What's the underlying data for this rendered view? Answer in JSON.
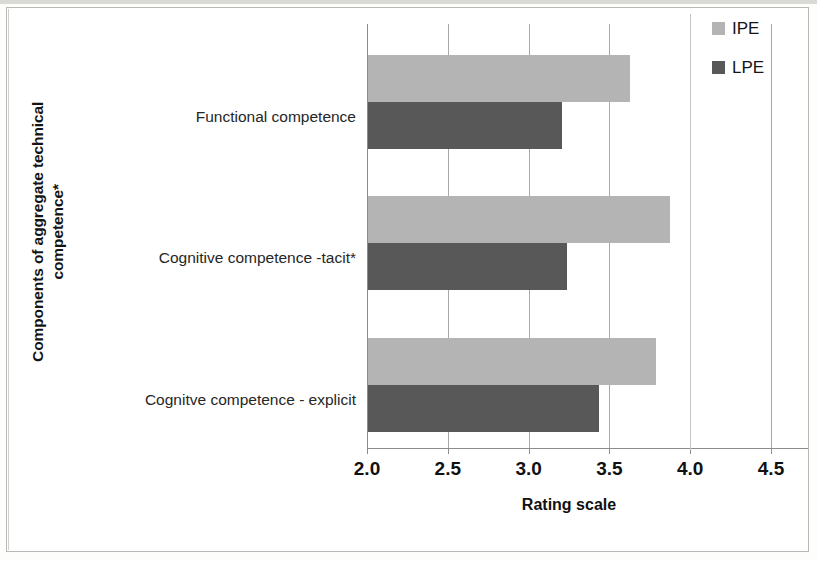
{
  "chart_data": {
    "type": "bar",
    "orientation": "horizontal",
    "title": "",
    "xlabel": "Rating scale",
    "ylabel": "Components of aggregate technical competence*",
    "categories": [
      "Functional competence",
      "Cognitive competence -tacit*",
      "Cognitve competence - explicit"
    ],
    "series": [
      {
        "name": "IPE",
        "color": "#b4b4b4",
        "values": [
          3.62,
          3.87,
          3.78
        ]
      },
      {
        "name": "LPE",
        "color": "#585858",
        "values": [
          3.2,
          3.23,
          3.43
        ]
      }
    ],
    "xlim": [
      2.0,
      4.5
    ],
    "xticks": [
      "2.0",
      "2.5",
      "3.0",
      "3.5",
      "4.0",
      "4.5"
    ],
    "xtick_values": [
      2.0,
      2.5,
      3.0,
      3.5,
      4.0,
      4.5
    ],
    "grid": "vertical",
    "legend_position": "top-right"
  },
  "axes": {
    "y_title_line1": "Components of aggregate technical",
    "y_title_line2": "competence*",
    "x_title": "Rating scale"
  },
  "legend": {
    "items": [
      {
        "label": "IPE",
        "color": "#b4b4b4"
      },
      {
        "label": "LPE",
        "color": "#585858"
      }
    ]
  },
  "colors": {
    "ipe": "#b4b4b4",
    "lpe": "#585858",
    "axis": "#8c8c8c",
    "grid": "#a8a8a5",
    "frame": "#b9b9b6",
    "text": "#1a1a1a",
    "background": "#ffffff"
  }
}
